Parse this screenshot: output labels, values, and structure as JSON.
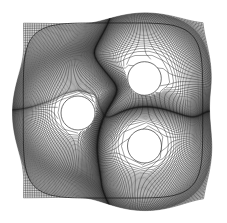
{
  "figure": {
    "title": "Structured curvilinear mesh around three circular holes",
    "type": "mesh-plot",
    "background_color": "#ffffff",
    "line_color": "#1a1a1a",
    "hole_fill_color": "#ffffff"
  },
  "chart_data": {
    "type": "mesh",
    "title": "Structured curvilinear mesh around three circular holes",
    "xlabel": "",
    "ylabel": "",
    "grid": true,
    "legend": null,
    "domain": {
      "shape": "square",
      "x_min": 9,
      "x_max": 217,
      "y_min": 9,
      "y_max": 212,
      "corner_rounding": 26
    },
    "holes": [
      {
        "name": "hole-top-right",
        "cx": 144.5,
        "cy": 78.5,
        "r": 16.8
      },
      {
        "name": "hole-left",
        "cx": 78.0,
        "cy": 113.0,
        "r": 17.0
      },
      {
        "name": "hole-bottom-right",
        "cx": 144.5,
        "cy": 146.0,
        "r": 17.0
      }
    ],
    "mesh": {
      "family_u_count": 150,
      "family_v_count": 150,
      "clustering": "refined toward holes and domain centre",
      "min_cell_px": 1.0,
      "max_cell_px": 7.0,
      "stroke_width": 0.42
    }
  }
}
